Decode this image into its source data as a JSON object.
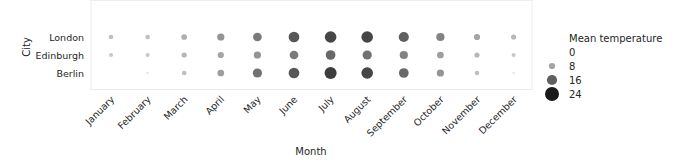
{
  "chart_data": {
    "type": "scatter",
    "subtype": "bubble-heatmap",
    "title": "",
    "xlabel": "Month",
    "ylabel": "City",
    "categories": [
      "January",
      "February",
      "March",
      "April",
      "May",
      "June",
      "July",
      "August",
      "September",
      "October",
      "November",
      "December"
    ],
    "cities": [
      "London",
      "Edinburgh",
      "Berlin"
    ],
    "series": [
      {
        "name": "London",
        "values": [
          5,
          5,
          7,
          10,
          13,
          17,
          19,
          19,
          16,
          12,
          8,
          6
        ]
      },
      {
        "name": "Edinburgh",
        "values": [
          4,
          4,
          6,
          8,
          10,
          13,
          15,
          14,
          12,
          9,
          6,
          4
        ]
      },
      {
        "name": "Berlin",
        "values": [
          0,
          1,
          5,
          9,
          14,
          17,
          20,
          19,
          15,
          10,
          5,
          1
        ]
      }
    ],
    "size_and_hue_encoding": "Mean temperature",
    "legend": {
      "title": "Mean temperature",
      "position": "right",
      "entries": [
        {
          "label": "0",
          "value": 0
        },
        {
          "label": "8",
          "value": 8
        },
        {
          "label": "16",
          "value": 16
        },
        {
          "label": "24",
          "value": 24
        }
      ]
    },
    "colormap": {
      "low": "#ffffff",
      "high": "#1a1a1a"
    },
    "grid": false,
    "axes_frame_color": "#ebebeb"
  }
}
